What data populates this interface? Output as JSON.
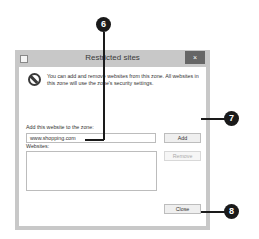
{
  "dialog": {
    "title": "Restricted sites",
    "close_glyph": "×",
    "info_text": "You can add and remove websites from this zone. All websites in this zone will use the zone's security settings.",
    "add_label": "Add this website to the zone:",
    "add_value": "www.shopping.com",
    "websites_label": "Websites:",
    "add_button": "Add",
    "remove_button": "Remove",
    "close_button": "Close"
  },
  "callouts": {
    "six": "6",
    "seven": "7",
    "eight": "8"
  }
}
